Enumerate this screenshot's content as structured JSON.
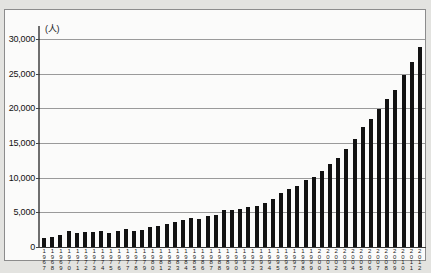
{
  "chart_data": {
    "type": "bar",
    "title": "",
    "subtitle": "",
    "xlabel": "",
    "ylabel": "",
    "unit_label": "(人)",
    "ylim": [
      0,
      31000
    ],
    "ytick_values": [
      0,
      5000,
      10000,
      15000,
      20000,
      25000,
      30000
    ],
    "ytick_labels": [
      "0",
      "5,000",
      "10,000",
      "15,000",
      "20,000",
      "25,000",
      "30,000"
    ],
    "grid": true,
    "legend": null,
    "bar_color": "#121212",
    "grid_color": "#9a9a9a",
    "categories": [
      "1967",
      "1968",
      "1969",
      "1970",
      "1971",
      "1972",
      "1973",
      "1974",
      "1975",
      "1976",
      "1977",
      "1978",
      "1979",
      "1980",
      "1981",
      "1982",
      "1983",
      "1984",
      "1985",
      "1986",
      "1987",
      "1988",
      "1989",
      "1990",
      "1991",
      "1992",
      "1993",
      "1994",
      "1995",
      "1996",
      "1997",
      "1998",
      "1999",
      "2000",
      "2001",
      "2002",
      "2003",
      "2004",
      "2005",
      "2006",
      "2007",
      "2008",
      "2009",
      "2010",
      "2011",
      "2012"
    ],
    "values": [
      1300,
      1500,
      1700,
      2300,
      2000,
      2100,
      2150,
      2250,
      1950,
      2300,
      2550,
      2350,
      2400,
      2850,
      3000,
      3350,
      3650,
      3900,
      4150,
      4050,
      4400,
      4650,
      5300,
      5400,
      5450,
      5700,
      5900,
      6400,
      6900,
      7850,
      8300,
      8750,
      9650,
      10050,
      11000,
      11950,
      12800,
      14150,
      15600,
      17350,
      18500,
      19850,
      21300,
      22600,
      24850,
      26700
    ],
    "last_value": 28850
  }
}
